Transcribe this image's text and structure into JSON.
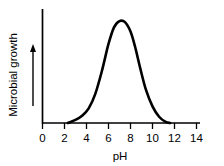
{
  "chart_data": {
    "type": "line",
    "title": "",
    "subtitle": "",
    "xlabel": "pH",
    "ylabel": "Microbial growth",
    "xlim": [
      0,
      14
    ],
    "ylim": [
      0,
      1
    ],
    "grid": false,
    "legend": null,
    "x_ticks": [
      "0",
      "2",
      "4",
      "6",
      "8",
      "10",
      "12",
      "14"
    ],
    "x_tick_values": [
      0,
      2,
      4,
      6,
      8,
      10,
      12,
      14
    ],
    "y_ticks": [],
    "y_axis_arrow": "up-arrow",
    "series": [
      {
        "name": "Microbial growth vs pH",
        "x": [
          2.3,
          3.0,
          3.6,
          4.2,
          4.8,
          5.4,
          6.0,
          6.5,
          7.0,
          7.5,
          8.0,
          8.4,
          8.9,
          9.4,
          10.0,
          10.6,
          11.2,
          11.6
        ],
        "values": [
          0.0,
          0.03,
          0.07,
          0.14,
          0.28,
          0.5,
          0.76,
          0.92,
          0.98,
          0.97,
          0.88,
          0.74,
          0.52,
          0.32,
          0.16,
          0.06,
          0.01,
          0.0
        ]
      }
    ],
    "annotations": [],
    "colors": {
      "curve": "#000000",
      "axis": "#000000",
      "background": "#ffffff",
      "text": "#000000"
    }
  },
  "figure": {
    "x_axis_label": "pH",
    "y_axis_label": "Microbial growth",
    "tick_0": "0",
    "tick_2": "2",
    "tick_4": "4",
    "tick_6": "6",
    "tick_8": "8",
    "tick_10": "10",
    "tick_12": "12",
    "tick_14": "14"
  }
}
